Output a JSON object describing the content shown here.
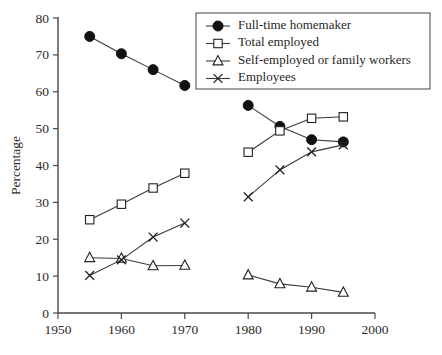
{
  "chart_data": {
    "type": "line",
    "title": "",
    "xlabel": "",
    "ylabel": "Percentage",
    "xlim": [
      1950,
      2000
    ],
    "ylim": [
      0,
      80
    ],
    "xticks": [
      1950,
      1960,
      1970,
      1980,
      1990,
      2000
    ],
    "yticks": [
      0,
      10,
      20,
      30,
      40,
      50,
      60,
      70,
      80
    ],
    "grid": false,
    "legend_position": "top-right",
    "note": "Each series is drawn as two separate segments: 1955-1970 and 1980-1995, with a gap in the 1970s.",
    "series": [
      {
        "name": "Full-time homemaker",
        "marker": "filled-circle",
        "segments": [
          {
            "x": [
              1955,
              1960,
              1965,
              1970
            ],
            "values": [
              75.0,
              70.3,
              66.0,
              61.7
            ]
          },
          {
            "x": [
              1980,
              1985,
              1990,
              1995
            ],
            "values": [
              56.3,
              50.6,
              47.0,
              46.4
            ]
          }
        ]
      },
      {
        "name": "Total employed",
        "marker": "open-square",
        "segments": [
          {
            "x": [
              1955,
              1960,
              1965,
              1970
            ],
            "values": [
              25.3,
              29.5,
              33.9,
              37.9
            ]
          },
          {
            "x": [
              1980,
              1985,
              1990,
              1995
            ],
            "values": [
              43.6,
              49.4,
              52.8,
              53.2
            ]
          }
        ]
      },
      {
        "name": "Self-employed or family workers",
        "marker": "open-triangle",
        "segments": [
          {
            "x": [
              1955,
              1960,
              1965,
              1970
            ],
            "values": [
              15.0,
              14.8,
              12.8,
              12.9
            ]
          },
          {
            "x": [
              1980,
              1985,
              1990,
              1995
            ],
            "values": [
              10.3,
              7.9,
              7.0,
              5.6
            ]
          }
        ]
      },
      {
        "name": "Employees",
        "marker": "x-cross",
        "segments": [
          {
            "x": [
              1955,
              1960,
              1965,
              1970
            ],
            "values": [
              10.2,
              14.4,
              20.6,
              24.4
            ]
          },
          {
            "x": [
              1980,
              1985,
              1990,
              1995
            ],
            "values": [
              31.5,
              38.8,
              43.7,
              45.6
            ]
          }
        ]
      }
    ]
  },
  "legend": {
    "entries": [
      {
        "label": "Full-time homemaker",
        "marker": "filled-circle"
      },
      {
        "label": "Total employed",
        "marker": "open-square"
      },
      {
        "label": "Self-employed or family workers",
        "marker": "open-triangle"
      },
      {
        "label": "Employees",
        "marker": "x-cross"
      }
    ]
  },
  "colors": {
    "axis": "#4a4a4a",
    "line": "#3a3a3a",
    "marker_fill_solid": "#111111",
    "marker_fill_open": "#ffffff",
    "marker_stroke": "#222222",
    "text": "#2b2b2b",
    "background": "#ffffff"
  }
}
